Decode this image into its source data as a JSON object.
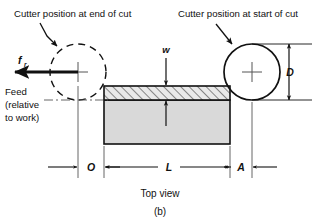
{
  "figure": {
    "caption": "Top view",
    "panel_label": "(b)",
    "view_type": "Top view of slab milling operation"
  },
  "callouts": {
    "left": "Cutter position at end of cut",
    "right": "Cutter position at start of cut"
  },
  "feed": {
    "symbol": "f",
    "subscript": "r",
    "lines": [
      "Feed",
      "(relative",
      "to work)"
    ],
    "direction": "left"
  },
  "dimensions": {
    "approach": "A",
    "length": "L",
    "overtravel": "O",
    "cutter_diameter": "D",
    "width_of_cut": "w"
  },
  "colors": {
    "line": "#111111",
    "workpiece_fill": "#d9d9d9",
    "hatch_fill": "#e8e8e8",
    "background": "#ffffff"
  }
}
